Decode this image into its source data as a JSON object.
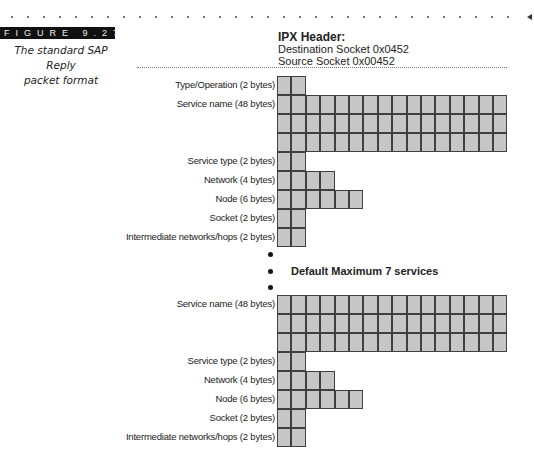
{
  "figure": {
    "label": "FIGURE 9.27",
    "caption_line1": "The standard SAP Reply",
    "caption_line2": "packet format"
  },
  "ipx_header": {
    "title": "IPX Header:",
    "destination": "Destination Socket 0x0452",
    "source": "Source Socket 0x00452"
  },
  "block1": {
    "rows": [
      {
        "label": "Type/Operation (2 bytes)",
        "cells": 2
      },
      {
        "label": "Service name (48 bytes)",
        "cells": 16
      },
      {
        "label": "",
        "cells": 16
      },
      {
        "label": "",
        "cells": 16
      },
      {
        "label": "Service type (2 bytes)",
        "cells": 2
      },
      {
        "label": "Network (4 bytes)",
        "cells": 4
      },
      {
        "label": "Node (6 bytes)",
        "cells": 6
      },
      {
        "label": "Socket (2 bytes)",
        "cells": 2
      },
      {
        "label": "Intermediate networks/hops (2 bytes)",
        "cells": 2
      }
    ]
  },
  "separator": {
    "text": "Default Maximum 7 services",
    "bullets": 3
  },
  "block2": {
    "rows": [
      {
        "label": "Service name (48 bytes)",
        "cells": 16
      },
      {
        "label": "",
        "cells": 16
      },
      {
        "label": "",
        "cells": 16
      },
      {
        "label": "Service type (2 bytes)",
        "cells": 2
      },
      {
        "label": "Network (4 bytes)",
        "cells": 4
      },
      {
        "label": "Node (6 bytes)",
        "cells": 6
      },
      {
        "label": "Socket (2 bytes)",
        "cells": 2
      },
      {
        "label": "Intermediate networks/hops (2 bytes)",
        "cells": 2
      }
    ]
  },
  "colors": {
    "cell_fill": "#c6c6c6",
    "cell_border": "#3f3f3f",
    "figure_bar": "#111111"
  }
}
